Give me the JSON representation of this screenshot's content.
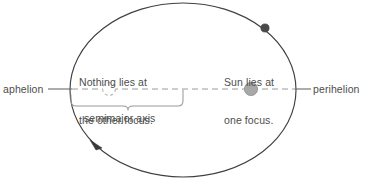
{
  "diagram": {
    "labels": {
      "aphelion": "aphelion",
      "perihelion": "perihelion",
      "other_focus_line1": "Nothing lies at",
      "other_focus_line2": "the other focus.",
      "sun_focus_line1": "Sun lies at",
      "sun_focus_line2": "one focus.",
      "semimajor_axis": "semimajor axis"
    },
    "colors": {
      "orbit_stroke": "#404040",
      "axis_dash": "#9a9a9a",
      "text": "#4d4d4d",
      "sun_fill": "#a8a8a8",
      "sun_stroke": "#8f8f8f",
      "planet_fill": "#4a4a4a",
      "empty_focus_stroke": "#b5b5b5",
      "brace_stroke": "#9a9a9a",
      "leader_line": "#6b6b6b",
      "background": "#ffffff"
    },
    "geometry": {
      "ellipse_center_x": 183,
      "ellipse_center_y": 90,
      "ellipse_rx": 113,
      "ellipse_ry": 87,
      "sun_focus_x": 251,
      "sun_focus_y": 89,
      "empty_focus_x": 109,
      "empty_focus_y": 89,
      "planet_x": 265,
      "planet_y": 28,
      "arrowhead_x": 97,
      "arrowhead_y": 146,
      "semimajor_brace_left_x": 70,
      "semimajor_brace_right_x": 183,
      "semimajor_brace_y": 101
    }
  }
}
